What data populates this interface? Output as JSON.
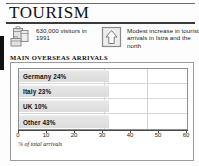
{
  "header": {
    "title": "TOURISM"
  },
  "facts": [
    {
      "icon": "luggage-icon",
      "text": "630,000 visitors in 1991"
    },
    {
      "icon": "up-arrow-icon",
      "text": "Modest increase in tourist arrivals in Istra and the north"
    }
  ],
  "chart_data": {
    "type": "bar",
    "orientation": "horizontal",
    "title": "MAIN OVERSEAS ARRIVALS",
    "xlabel": "% of total arrivals",
    "ylabel": "",
    "categories": [
      "Germany",
      "Italy",
      "UK",
      "Other"
    ],
    "values": [
      24,
      23,
      10,
      43
    ],
    "bar_labels": [
      "Germany 24%",
      "Italy 23%",
      "UK 10%",
      "Other 43%"
    ],
    "bar_drawn_length_pct": [
      32,
      32,
      32,
      32
    ],
    "xlim": [
      0,
      60
    ],
    "xticks": [
      0,
      10,
      20,
      30,
      40,
      50,
      60
    ],
    "xticklabels": [
      "0",
      "10",
      "20",
      "30",
      "40",
      "50",
      "60"
    ],
    "grid": true,
    "gridlines_at": [
      30,
      45
    ],
    "legend": null,
    "bar_color": "#e0e0e0",
    "frame_color": "#8f8f8f"
  }
}
